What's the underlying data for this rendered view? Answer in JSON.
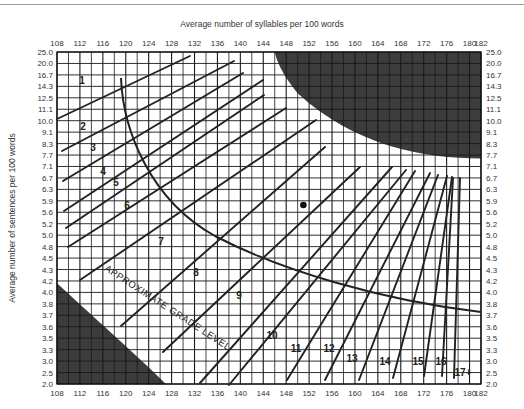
{
  "chart_data": {
    "type": "line",
    "xlabel": "Average number of syllables per 100 words",
    "ylabel": "Average number of sentences per 100 words",
    "x_ticks": [
      108,
      112,
      116,
      120,
      124,
      128,
      132,
      136,
      140,
      144,
      148,
      152,
      156,
      160,
      164,
      168,
      172,
      176,
      180,
      182
    ],
    "y_ticks": [
      25.0,
      20.0,
      16.7,
      14.3,
      12.5,
      11.1,
      10.0,
      9.1,
      8.3,
      7.7,
      7.1,
      6.7,
      6.3,
      5.9,
      5.6,
      5.2,
      5.0,
      4.8,
      4.5,
      4.3,
      4.2,
      4.0,
      3.8,
      3.7,
      3.6,
      3.5,
      3.3,
      3.0,
      2.5,
      2.0
    ],
    "xlim": [
      108,
      182
    ],
    "ylim": [
      2.0,
      25.0
    ],
    "grid": true,
    "annotation": "APPROXIMATE GRADE LEVEL",
    "grade_labels": [
      "1",
      "2",
      "3",
      "4",
      "5",
      "6",
      "7",
      "8",
      "9",
      "10",
      "11",
      "12",
      "13",
      "14",
      "15",
      "16",
      "17+"
    ],
    "sample_point": {
      "x": 151,
      "y": 6.0
    },
    "invalid_regions": [
      "upper-right (long sentences, many syllables)",
      "lower-left (short sentences, few syllables)"
    ]
  },
  "labels": {
    "x_title": "Average number of syllables per 100 words",
    "y_title": "Average number of sentences per 100 words",
    "grade_level": "APPROXIMATE GRADE LEVEL"
  }
}
